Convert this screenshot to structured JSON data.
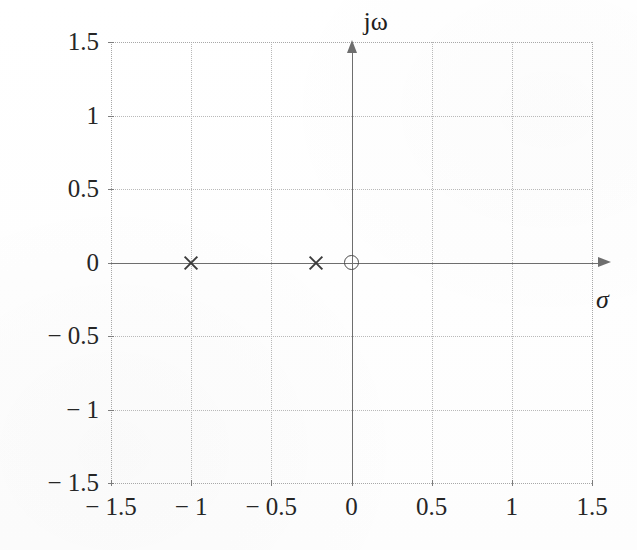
{
  "figure": {
    "kind": "pole-zero-plot",
    "axis_labels": {
      "vertical": "jω",
      "horizontal": "σ"
    },
    "colors": {
      "background": "#fefefe",
      "grid": "#b9b9b9",
      "axis": "#6e6e6e",
      "pole": "#3b3b3b",
      "zero": "#4a4a4a",
      "text": "#262626"
    }
  },
  "chart_data": {
    "type": "scatter",
    "title": "",
    "xlabel": "σ",
    "ylabel": "jω",
    "xlim": [
      -1.5,
      1.5
    ],
    "ylim": [
      -1.5,
      1.5
    ],
    "grid": true,
    "legend": "none",
    "xticks": [
      -1.5,
      -1,
      -0.5,
      0,
      0.5,
      1,
      1.5
    ],
    "yticks": [
      -1.5,
      -1,
      -0.5,
      0,
      0.5,
      1,
      1.5
    ],
    "xtick_labels": [
      "− 1.5",
      "− 1",
      "− 0.5",
      "0",
      "0.5",
      "1",
      "1.5"
    ],
    "ytick_labels": [
      "1.5",
      "1",
      "0.5",
      "0",
      "− 0.5",
      "− 1",
      "− 1.5"
    ],
    "series": [
      {
        "name": "poles",
        "marker": "x",
        "points": [
          {
            "x": -1.0,
            "y": 0.0
          },
          {
            "x": -0.22,
            "y": 0.0
          }
        ]
      },
      {
        "name": "zeros",
        "marker": "o",
        "points": [
          {
            "x": 0.0,
            "y": 0.0
          }
        ]
      }
    ]
  }
}
